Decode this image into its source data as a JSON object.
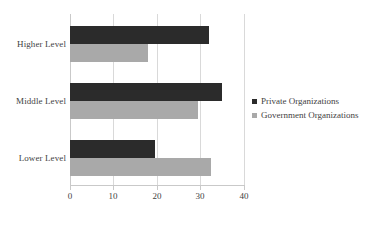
{
  "chart_data": {
    "type": "bar",
    "orientation": "horizontal",
    "title": "",
    "subtitle": "",
    "xlabel": "",
    "ylabel": "",
    "categories": [
      "Higher Level",
      "Middle Level",
      "Lower Level"
    ],
    "series": [
      {
        "name": "Private Organizations",
        "color": "#2b2b2b",
        "values": [
          32,
          35,
          19.5
        ]
      },
      {
        "name": "Government Organizations",
        "color": "#a9a9a9",
        "values": [
          18,
          29.5,
          32.5
        ]
      }
    ],
    "xlim": [
      0,
      40
    ],
    "xticks": [
      0,
      10,
      20,
      30,
      40
    ],
    "xtick_labels": [
      "0",
      "10",
      "20",
      "30",
      "40"
    ],
    "grid": true,
    "grid_axis": "x",
    "grid_color": "#d9d9d9",
    "legend_position": "right"
  },
  "legend": {
    "entries": [
      {
        "label": "Private Organizations",
        "swatch": "legend-swatch-private"
      },
      {
        "label": "Government Organizations",
        "swatch": "legend-swatch-government"
      }
    ]
  }
}
